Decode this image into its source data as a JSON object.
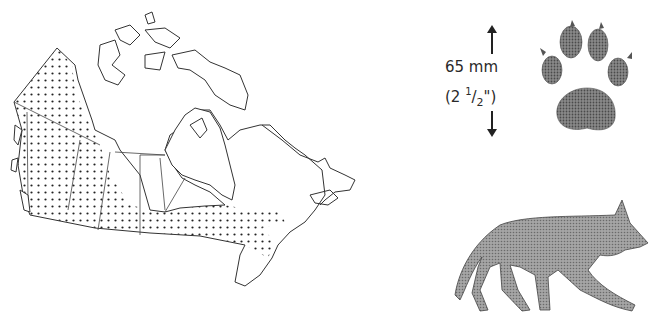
{
  "map": {
    "subject": "Canada range map",
    "pattern": "dotted",
    "range_color": "#222222"
  },
  "track": {
    "measure_metric": "65 mm",
    "measure_imperial_prefix": "(2 ",
    "measure_imperial_num": "1",
    "measure_imperial_sep": "/",
    "measure_imperial_den": "2",
    "measure_imperial_suffix": "\")"
  },
  "colors": {
    "silhouette_fill": "#8c8c8c",
    "paw_fill": "#6e6e6e",
    "outline": "#333333"
  }
}
